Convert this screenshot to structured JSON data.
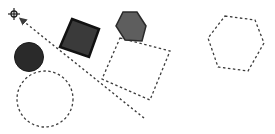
{
  "canvas": {
    "width": 275,
    "height": 134,
    "background": "#ffffff"
  },
  "colors": {
    "dashed_stroke": "#3c3c3c",
    "solid_square_fill": "#3a3a3a",
    "solid_square_stroke": "#111111",
    "solid_hexagon_fill": "#5e5e5e",
    "solid_hexagon_stroke": "#2a2a2a",
    "solid_circle_fill": "#2a2a2a",
    "crosshair": "#222222"
  },
  "shapes": {
    "crosshair": {
      "icon": "crosshair-icon",
      "cx": 14,
      "cy": 14
    },
    "arrow": {
      "from": [
        144,
        118
      ],
      "to": [
        22,
        20
      ],
      "style": "dashed"
    },
    "solid_circle": {
      "cx": 29,
      "cy": 57,
      "r": 14.5
    },
    "dashed_circle": {
      "cx": 45,
      "cy": 99,
      "r": 28
    },
    "solid_square": {
      "points": "72,19 99,29 89,57 60,47"
    },
    "dashed_square": {
      "points": "120,38 170,51 150,100 102,79"
    },
    "solid_hexagon": {
      "points": "123,12 137,12 146,26 142,41 125,40 116,26"
    },
    "dashed_hexagon": {
      "points": "225,16 255,20 264,43 248,71 218,67 208,38"
    }
  }
}
